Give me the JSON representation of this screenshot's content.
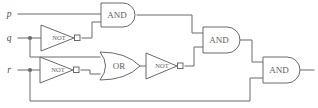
{
  "diagram": {
    "type": "logic-circuit",
    "width": 318,
    "height": 108,
    "background_color": "#ffffff",
    "line_color": "#6a6a6a",
    "text_color": "#5d5d5d"
  },
  "inputs": [
    {
      "id": "p",
      "label": "p",
      "x": 9,
      "y": 14
    },
    {
      "id": "q",
      "label": "q",
      "x": 9,
      "y": 38
    },
    {
      "id": "r",
      "label": "r",
      "x": 9,
      "y": 70
    }
  ],
  "gates": [
    {
      "id": "not1",
      "type": "NOT",
      "label": "NOT",
      "label_x": 59,
      "label_y": 38,
      "x": 41,
      "y": 25,
      "width": 36,
      "height": 26
    },
    {
      "id": "and1",
      "type": "AND",
      "label": "AND",
      "label_x": 117,
      "label_y": 15,
      "x": 101,
      "y": 3,
      "width": 36,
      "height": 24
    },
    {
      "id": "not2",
      "type": "NOT",
      "label": "NOT",
      "label_x": 58,
      "label_y": 70,
      "x": 40,
      "y": 57,
      "width": 36,
      "height": 26
    },
    {
      "id": "or1",
      "type": "OR",
      "label": "OR",
      "label_x": 120,
      "label_y": 66,
      "x": 100,
      "y": 52,
      "width": 40,
      "height": 28
    },
    {
      "id": "not3",
      "type": "NOT",
      "label": "NOT",
      "label_x": 163,
      "label_y": 66,
      "x": 146,
      "y": 53,
      "width": 34,
      "height": 26
    },
    {
      "id": "and2",
      "type": "AND",
      "label": "AND",
      "label_x": 219,
      "label_y": 40,
      "x": 203,
      "y": 27,
      "width": 37,
      "height": 26
    },
    {
      "id": "and3",
      "type": "AND",
      "label": "AND",
      "label_x": 279,
      "label_y": 70,
      "x": 263,
      "y": 57,
      "width": 37,
      "height": 26
    }
  ],
  "junctions": [
    {
      "id": "q-branch",
      "cx": 30,
      "cy": 38
    },
    {
      "id": "r-branch",
      "cx": 30,
      "cy": 70
    }
  ],
  "wires": [
    {
      "id": "p-to-and1",
      "path": "M 18 14 L 101 14"
    },
    {
      "id": "q-to-not1",
      "path": "M 18 38 L 41 38"
    },
    {
      "id": "q-branch-down",
      "path": "M 30 38 L 30 57 L 100 57"
    },
    {
      "id": "not1-out-to-and1",
      "path": "M 82 38 L 92 38 L 92 22 L 101 22"
    },
    {
      "id": "r-to-not2",
      "path": "M 18 70 L 40 70"
    },
    {
      "id": "r-branch-down",
      "path": "M 30 70 L 30 101 L 250 101 L 250 78 L 263 78"
    },
    {
      "id": "not2-out-to-or1",
      "path": "M 81 70 L 90 70 L 90 74 L 100 74"
    },
    {
      "id": "and1-out-to-and2",
      "path": "M 137 15 L 192 15 L 192 33 L 203 33"
    },
    {
      "id": "or1-out-to-not3",
      "path": "M 140 66 L 146 66"
    },
    {
      "id": "not3-out-to-and2",
      "path": "M 185 66 L 194 66 L 194 47 L 203 47"
    },
    {
      "id": "and2-out-to-and3",
      "path": "M 240 40 L 252 40 L 252 62 L 263 62"
    },
    {
      "id": "and3-output",
      "path": "M 300 70 L 314 70"
    }
  ],
  "output": {
    "id": "circuit-output",
    "label": ""
  }
}
